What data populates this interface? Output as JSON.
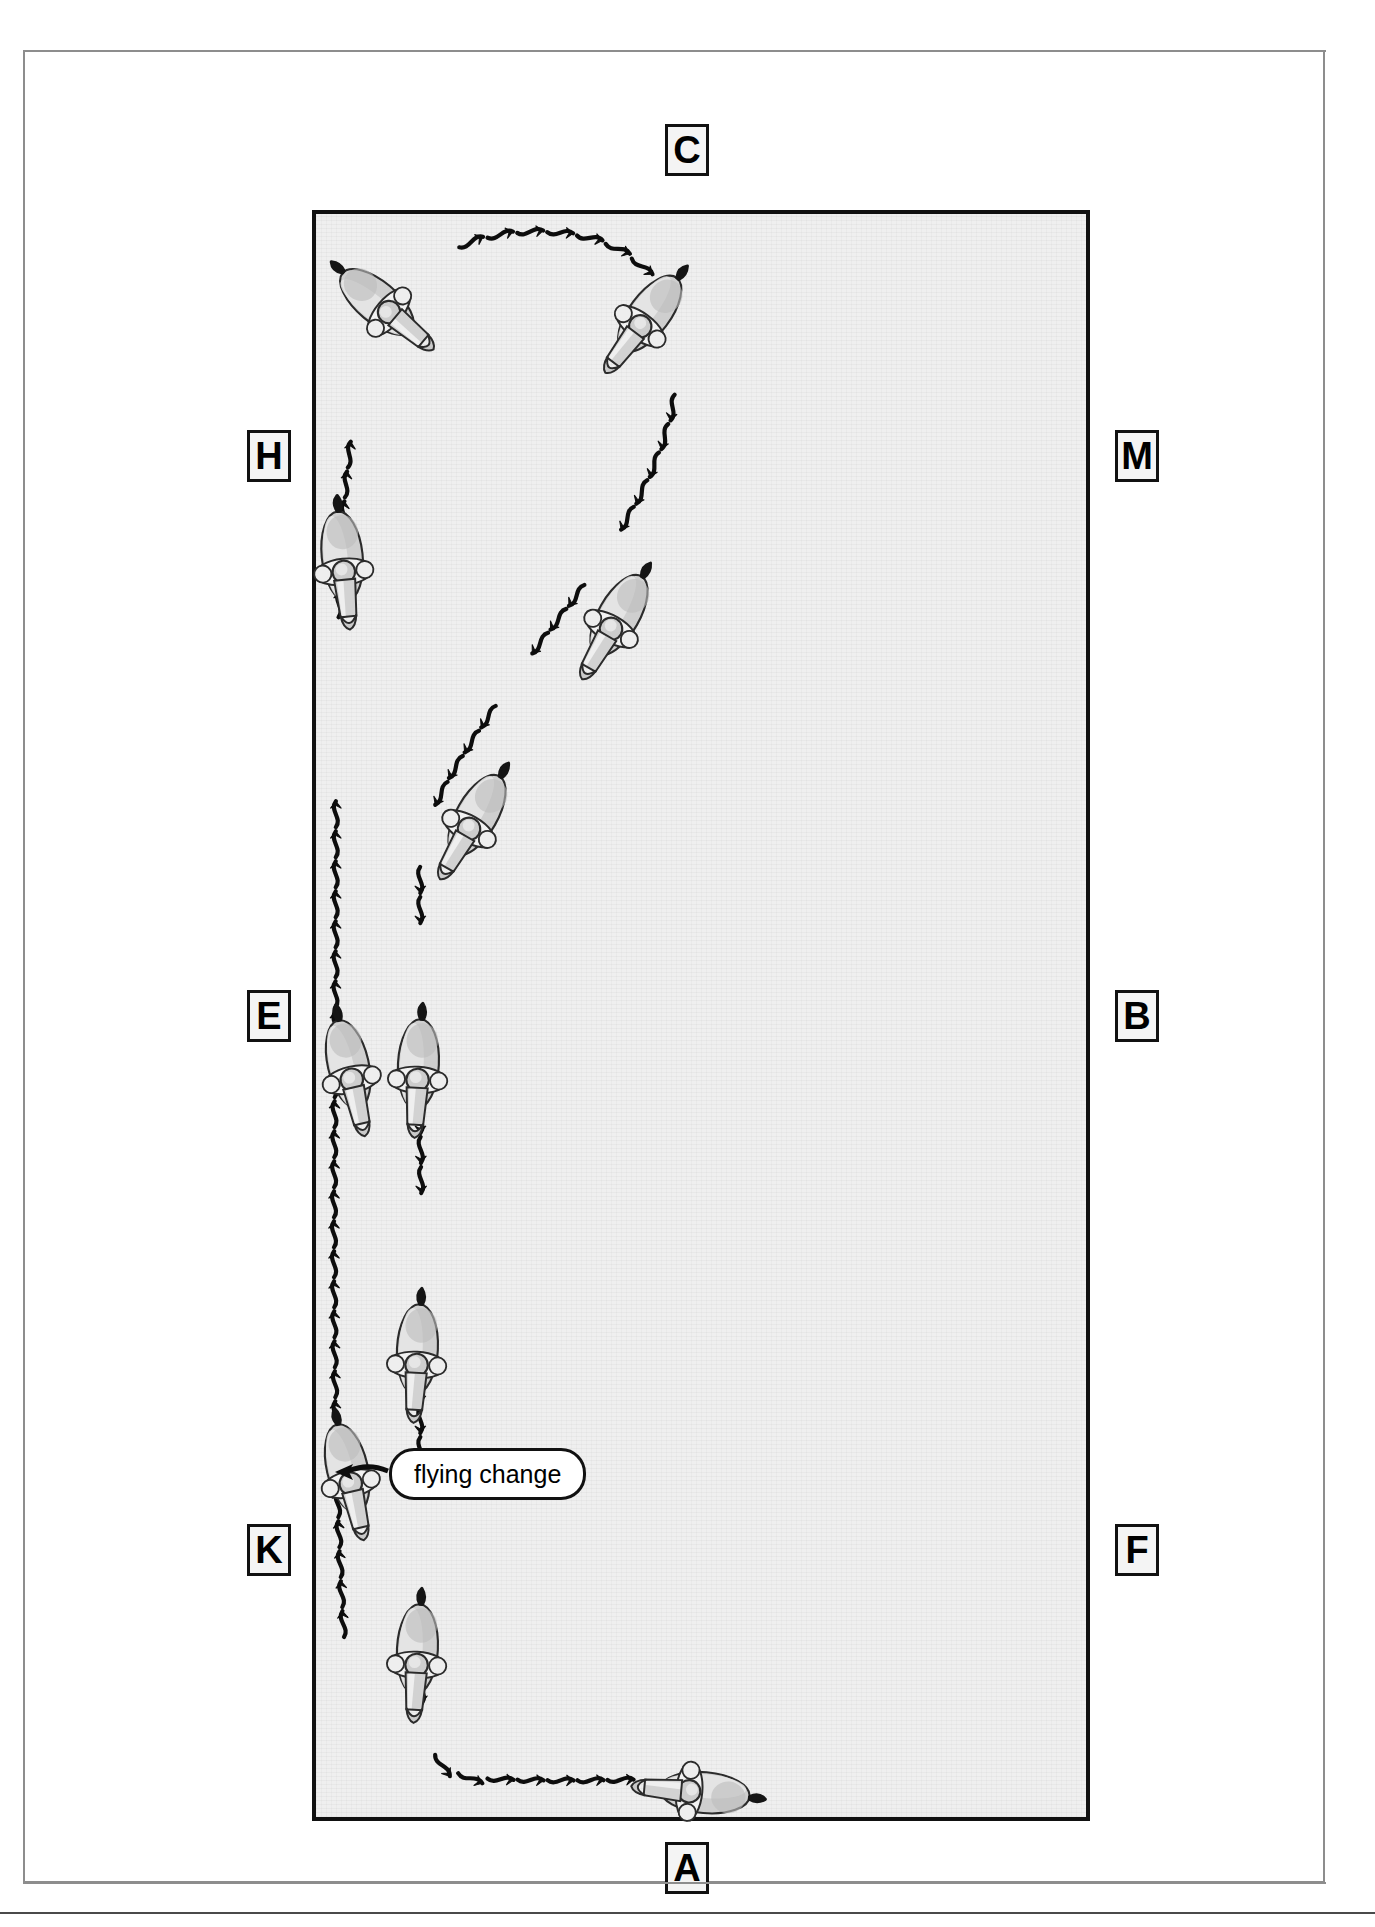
{
  "diagram": {
    "type": "dressage-arena-figure",
    "arena": {
      "surface_color": "#efefef",
      "border_color": "#111111",
      "frame_color": "#8d8d8d"
    },
    "letters": [
      {
        "id": "C",
        "label": "C",
        "side": "top",
        "x": 640,
        "y": 72
      },
      {
        "id": "H",
        "label": "H",
        "side": "left",
        "x": 222,
        "y": 378
      },
      {
        "id": "M",
        "label": "M",
        "side": "right",
        "x": 1090,
        "y": 378
      },
      {
        "id": "E",
        "label": "E",
        "side": "left",
        "x": 222,
        "y": 938
      },
      {
        "id": "B",
        "label": "B",
        "side": "right",
        "x": 1090,
        "y": 938
      },
      {
        "id": "K",
        "label": "K",
        "side": "left",
        "x": 222,
        "y": 1472
      },
      {
        "id": "F",
        "label": "F",
        "side": "right",
        "x": 1090,
        "y": 1472
      },
      {
        "id": "A",
        "label": "A",
        "side": "bottom",
        "x": 640,
        "y": 1790
      }
    ],
    "annotations": [
      {
        "id": "flying-change",
        "label": "flying change",
        "shape": "rounded-pill",
        "leader": "arrow-left",
        "target_x": 390,
        "target_y": 1418
      }
    ],
    "horses": [
      {
        "id": "h1",
        "x": 358,
        "y": 255,
        "rotation": -50
      },
      {
        "id": "h2",
        "x": 620,
        "y": 268,
        "rotation": 37
      },
      {
        "id": "h3",
        "x": 318,
        "y": 512,
        "rotation": -6
      },
      {
        "id": "h4",
        "x": 590,
        "y": 570,
        "rotation": 30
      },
      {
        "id": "h5",
        "x": 448,
        "y": 770,
        "rotation": 30
      },
      {
        "id": "h6",
        "x": 325,
        "y": 1020,
        "rotation": -13
      },
      {
        "id": "h7",
        "x": 393,
        "y": 1020,
        "rotation": 3
      },
      {
        "id": "h8",
        "x": 392,
        "y": 1305,
        "rotation": 3
      },
      {
        "id": "h9",
        "x": 324,
        "y": 1424,
        "rotation": -13
      },
      {
        "id": "h10",
        "x": 392,
        "y": 1605,
        "rotation": 3
      },
      {
        "id": "h11",
        "x": 672,
        "y": 1740,
        "rotation": 95
      }
    ],
    "track": {
      "style": "wavy-serpentine-with-arrowheads",
      "stroke_color": "#0d0d0d",
      "description": "Counter-change / serpentine track with flying change on centre line"
    }
  }
}
